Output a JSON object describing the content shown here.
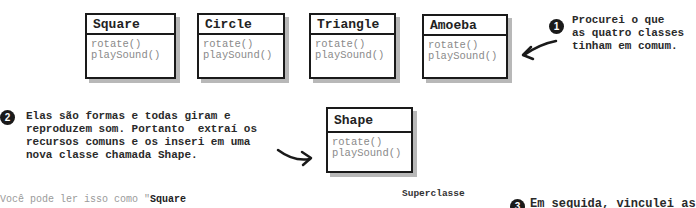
{
  "classes": [
    {
      "name": "Square",
      "methods": [
        "rotate()",
        "playSound()"
      ]
    },
    {
      "name": "Circle",
      "methods": [
        "rotate()",
        "playSound()"
      ]
    },
    {
      "name": "Triangle",
      "methods": [
        "rotate()",
        "playSound()"
      ]
    },
    {
      "name": "Amoeba",
      "methods": [
        "rotate()",
        "playSound()"
      ]
    }
  ],
  "superclass": {
    "name": "Shape",
    "methods": [
      "rotate()",
      "playSound()"
    ]
  },
  "notes": {
    "step1": {
      "number": "1",
      "text": "Procurei o que\nas quatro classes\ntinham em comum."
    },
    "step2": {
      "number": "2",
      "text": "Elas são formas e todas giram e\nreproduzem som. Portanto  extraí os\nrecursos comuns e os inseri em uma\nnova classe chamada Shape."
    },
    "step3": {
      "number": "3",
      "text": "Em seguida, vinculei as"
    }
  },
  "reading": {
    "prefix": "Você pode ler isso como \"",
    "bold": "Square"
  },
  "superclass_label": "Superclasse"
}
